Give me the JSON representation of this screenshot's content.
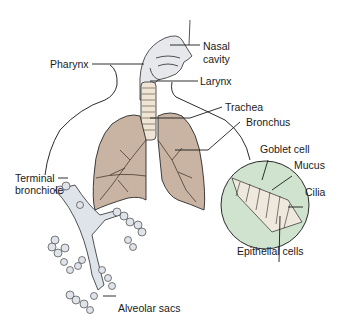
{
  "diagram": {
    "colors": {
      "lung_fill": "#c9b4a3",
      "airway_fill": "#dfe3ea",
      "inset_fill": "#cfe3cf",
      "outline": "#2a2a2a",
      "text": "#1a1a1a"
    },
    "labels": {
      "nasal_cavity_line1": "Nasal",
      "nasal_cavity_line2": "cavity",
      "pharynx": "Pharynx",
      "larynx": "Larynx",
      "trachea": "Trachea",
      "bronchus": "Bronchus",
      "goblet_cell": "Goblet cell",
      "mucus": "Mucus",
      "cilia": "Cilia",
      "epithelial_cells": "Epithelial cells",
      "terminal_bronchiole_line1": "Terminal",
      "terminal_bronchiole_line2": "bronchiole",
      "alveolar_sacs": "Alveolar sacs"
    }
  }
}
